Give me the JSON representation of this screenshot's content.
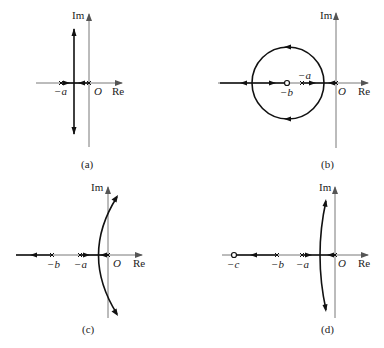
{
  "figure": {
    "panels": [
      {
        "id": "a",
        "caption": "(a)",
        "axis_labels": {
          "im": "Im",
          "re": "Re",
          "origin": "O"
        },
        "points": [
          {
            "label": "−a",
            "type": "pole",
            "x": 61
          },
          {
            "label": "",
            "type": "pole",
            "x": 89
          }
        ],
        "locus": "two real poles meet between them then branch vertically to ±j∞"
      },
      {
        "id": "b",
        "caption": "(b)",
        "axis_labels": {
          "im": "Im",
          "re": "Re",
          "origin": "O"
        },
        "points": [
          {
            "label": "−b",
            "type": "zero",
            "x": 287
          },
          {
            "label": "−a",
            "type": "pole",
            "x": 302
          },
          {
            "label": "",
            "type": "pole",
            "x": 336
          }
        ],
        "locus": "circle centered at the zero −b; break-away near origin, break-in left of circle, one branch to −∞"
      },
      {
        "id": "c",
        "caption": "(c)",
        "axis_labels": {
          "im": "Im",
          "re": "Re",
          "origin": "O"
        },
        "points": [
          {
            "label": "−b",
            "type": "pole",
            "x": 52
          },
          {
            "label": "−a",
            "type": "pole",
            "x": 80
          },
          {
            "label": "",
            "type": "pole",
            "x": 108
          }
        ],
        "locus": "branches curve into right half plane asymptotically; one branch along real axis to −∞"
      },
      {
        "id": "d",
        "caption": "(d)",
        "axis_labels": {
          "im": "Im",
          "re": "Re",
          "origin": "O"
        },
        "points": [
          {
            "label": "−c",
            "type": "zero",
            "x": 234
          },
          {
            "label": "−b",
            "type": "pole",
            "x": 277
          },
          {
            "label": "−a",
            "type": "pole",
            "x": 302
          },
          {
            "label": "",
            "type": "pole",
            "x": 335
          }
        ],
        "locus": "complex branches bend toward vertical asymptotes; real branch from −b to zero −c"
      }
    ]
  }
}
